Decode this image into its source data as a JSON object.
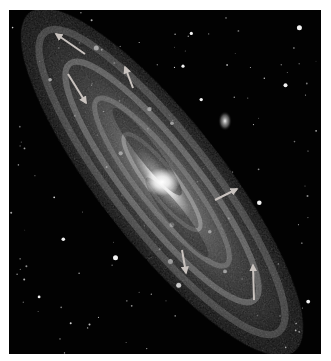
{
  "image": {
    "subject": "Spiral galaxy (Andromeda-like) in grayscale with annotation arrows",
    "background_color": "#020202",
    "border_color": "#ffffff",
    "arrow_color": "#c9c3bf",
    "core": {
      "x": 153,
      "y": 172,
      "color": "#ffffff"
    },
    "satellite_galaxy": {
      "x": 216,
      "y": 111
    },
    "arrows": [
      {
        "id": "arrow-top-left",
        "x1": 76,
        "y1": 44,
        "x2": 47,
        "y2": 24
      },
      {
        "id": "arrow-upper-left-down",
        "x1": 59,
        "y1": 64,
        "x2": 77,
        "y2": 93
      },
      {
        "id": "arrow-upper-mid-up",
        "x1": 124,
        "y1": 78,
        "x2": 116,
        "y2": 57
      },
      {
        "id": "arrow-mid-right",
        "x1": 206,
        "y1": 190,
        "x2": 228,
        "y2": 179
      },
      {
        "id": "arrow-lower-mid-down",
        "x1": 173,
        "y1": 240,
        "x2": 177,
        "y2": 263
      },
      {
        "id": "arrow-lower-right-up",
        "x1": 245,
        "y1": 290,
        "x2": 244,
        "y2": 255
      }
    ]
  }
}
